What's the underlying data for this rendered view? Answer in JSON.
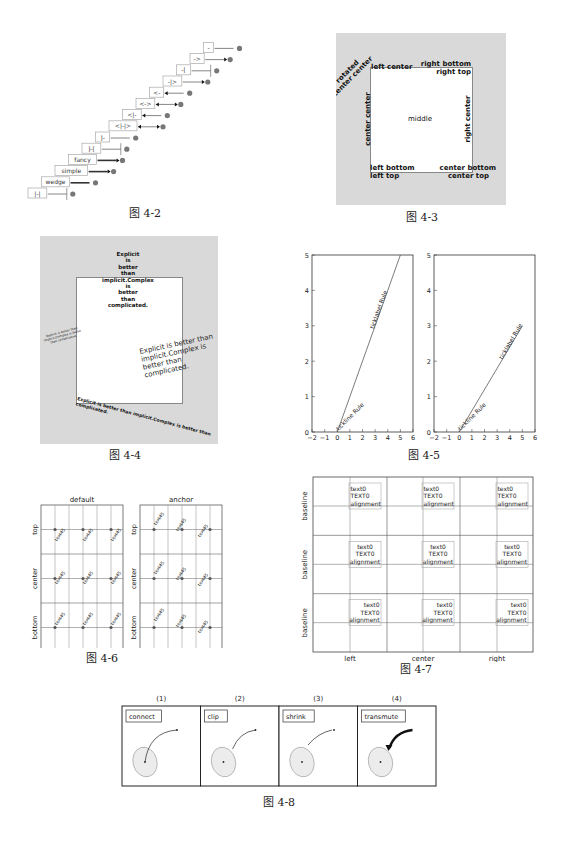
{
  "figures": {
    "fig_4_2": {
      "caption": "图 4-2",
      "arrow_styles": [
        "|-|",
        "wedge",
        "simple",
        "fancy",
        "]-[",
        "]-",
        "<|-|>",
        "<|-",
        "<->",
        "<-",
        "-|>",
        "-[",
        "->",
        "-"
      ]
    },
    "fig_4_3": {
      "caption": "图 4-3",
      "labels": {
        "rotated": "rotated\ncenter center",
        "rotated_line1": "rotated",
        "rotated_line2": "center center",
        "left_center": "left center",
        "right_bottom": "right bottom",
        "right_top": "right top",
        "center_center": "center center",
        "middle": "middle",
        "right_center": "right center",
        "left_bottom": "left bottom",
        "left_top": "left top",
        "center_bottom": "center bottom",
        "center_top": "center top"
      }
    },
    "fig_4_4": {
      "caption": "图 4-4",
      "top_lines": [
        "Explicit",
        "is",
        "better",
        "than",
        "implicit.Complex",
        "is",
        "better",
        "than",
        "complicated."
      ],
      "left_small_lines": [
        "Explicit is better than",
        "implicit.Complex is better",
        "than complicated."
      ],
      "right_lines": [
        "Explicit is better than",
        "implicit.Complex is",
        "better than",
        "complicated."
      ],
      "bottom_lines": [
        "Explicit is better than implicit.Complex is better than",
        "complicated."
      ]
    },
    "fig_4_5": {
      "caption": "图 4-5",
      "left_plot": {
        "label_tickline": "tickline Rule",
        "label_ticklabel": "ticklabel Rule"
      },
      "right_plot": {
        "label_tickline": "tickline Rule",
        "label_ticklabel": "ticklabel Rule"
      },
      "x_ticks": [
        "−2",
        "−1",
        "0",
        "1",
        "2",
        "3",
        "4",
        "5",
        "6"
      ],
      "y_ticks": [
        "0",
        "1",
        "2",
        "3",
        "4",
        "5"
      ]
    },
    "fig_4_6": {
      "caption": "图 4-6",
      "titles": [
        "default",
        "anchor"
      ],
      "row_labels": [
        "top",
        "center",
        "bottom"
      ],
      "col_labels": [
        "left",
        "center",
        "right"
      ],
      "cell_text": "text45"
    },
    "fig_4_7": {
      "caption": "图 4-7",
      "row_labels": [
        "baseline",
        "baseline",
        "baseline"
      ],
      "col_labels": [
        "left",
        "center",
        "right"
      ],
      "box_lines": [
        "text0",
        "TEXT0",
        "alignment"
      ]
    },
    "fig_4_8": {
      "caption": "图 4-8",
      "panels": [
        {
          "index": "(1)",
          "label": "connect"
        },
        {
          "index": "(2)",
          "label": "clip"
        },
        {
          "index": "(3)",
          "label": "shrink"
        },
        {
          "index": "(4)",
          "label": "transmute"
        }
      ]
    }
  },
  "chart_data": [
    {
      "type": "line",
      "title": "图 4-5 left",
      "x": [
        0,
        5
      ],
      "series": [
        {
          "name": "line",
          "values": [
            0,
            5
          ]
        }
      ],
      "annotations": [
        "tickline Rule",
        "ticklabel Rule"
      ],
      "xlim": [
        -2,
        6
      ],
      "ylim": [
        0,
        5
      ]
    },
    {
      "type": "line",
      "title": "图 4-5 right",
      "x": [
        0,
        5
      ],
      "series": [
        {
          "name": "line",
          "values": [
            0,
            3
          ]
        }
      ],
      "annotations": [
        "tickline Rule",
        "ticklabel Rule"
      ],
      "xlim": [
        -2,
        6
      ],
      "ylim": [
        0,
        5
      ]
    }
  ]
}
